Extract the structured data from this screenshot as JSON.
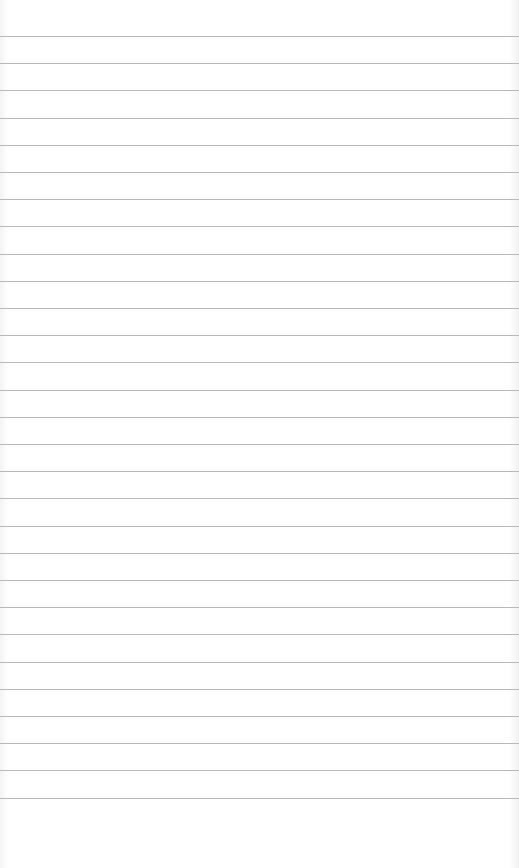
{
  "page": {
    "type": "ruled-paper",
    "background": "#ffffff",
    "line_color": "#b9b9b9",
    "first_line_y": 36,
    "line_spacing": 27.2,
    "line_count": 29,
    "text": ""
  }
}
